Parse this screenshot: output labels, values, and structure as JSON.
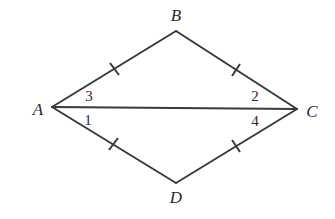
{
  "diagram": {
    "type": "geometry",
    "shape": "kite/rhombus with diagonal",
    "vertices": [
      {
        "name": "A",
        "x": 52,
        "y": 107,
        "label_x": 38,
        "label_y": 115
      },
      {
        "name": "B",
        "x": 176,
        "y": 31,
        "label_x": 176,
        "label_y": 21
      },
      {
        "name": "C",
        "x": 297,
        "y": 109,
        "label_x": 312,
        "label_y": 117
      },
      {
        "name": "D",
        "x": 176,
        "y": 183,
        "label_x": 176,
        "label_y": 203
      }
    ],
    "segments": [
      {
        "from": "A",
        "to": "B",
        "tick_marks": 1
      },
      {
        "from": "B",
        "to": "C",
        "tick_marks": 1
      },
      {
        "from": "C",
        "to": "D",
        "tick_marks": 1
      },
      {
        "from": "D",
        "to": "A",
        "tick_marks": 1
      },
      {
        "from": "A",
        "to": "C",
        "tick_marks": 0
      }
    ],
    "angle_labels": [
      {
        "label": "3",
        "vertex": "A",
        "position": "above diagonal",
        "x": 89,
        "y": 101
      },
      {
        "label": "1",
        "vertex": "A",
        "position": "below diagonal",
        "x": 88,
        "y": 125
      },
      {
        "label": "2",
        "vertex": "C",
        "position": "above diagonal",
        "x": 255,
        "y": 101
      },
      {
        "label": "4",
        "vertex": "C",
        "position": "below diagonal",
        "x": 255,
        "y": 126
      }
    ],
    "stroke_color": "#3a3a3a",
    "background_color": "#ffffff"
  }
}
